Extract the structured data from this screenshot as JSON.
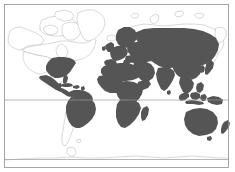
{
  "figure": {
    "type": "world-distribution-map",
    "projection": "mercator",
    "title": "",
    "width_px": 235,
    "height_px": 172,
    "background_color": "#ffffff"
  },
  "style": {
    "frame_color": "#8f8f8f",
    "frame_width": 0.8,
    "graticule_color": "#9a9a9a",
    "graticule_width": 0.7,
    "coastline_color": "#b9b9b9",
    "coastline_width": 0.55,
    "land_unshaded_fill": "#ffffff",
    "land_shaded_fill": "#555555",
    "land_shaded_stroke": "#555555"
  },
  "frame": {
    "x": 4.5,
    "y": 4.5,
    "width": 224,
    "height": 163
  },
  "graticules": {
    "horizontal_lines": [
      {
        "name": "equator",
        "y": 100
      },
      {
        "name": "southern-parallel",
        "y": 159.5
      }
    ],
    "vertical_lines": []
  },
  "legend": {
    "visible": false,
    "entries": [
      {
        "label": "present",
        "color": "#555555"
      },
      {
        "label": "absent",
        "color": "#ffffff"
      }
    ]
  },
  "regions": {
    "shaded": [
      "Eastern United States",
      "Mexico",
      "Central America",
      "Caribbean",
      "Northern South America",
      "Brazil",
      "Africa",
      "Madagascar",
      "Southern Europe",
      "Northern Europe",
      "Russia",
      "Middle East",
      "India",
      "China",
      "Korea",
      "Japan",
      "Southeast Asia",
      "Indonesia",
      "Philippines",
      "Papua New Guinea",
      "Australia",
      "New Zealand"
    ],
    "unshaded": [
      "Canada",
      "Alaska",
      "Greenland",
      "Western United States",
      "Chile",
      "Argentina",
      "Iceland",
      "Antarctica"
    ]
  },
  "annotations": []
}
